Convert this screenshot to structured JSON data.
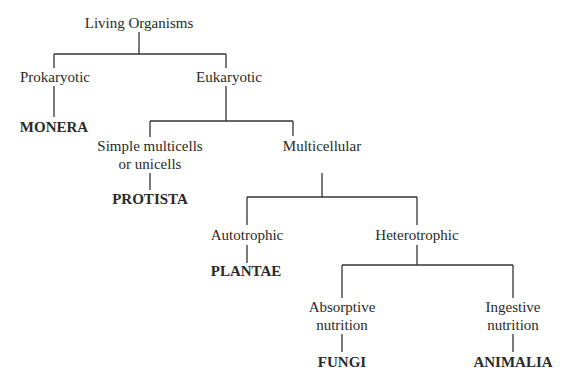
{
  "title": "Living Organisms",
  "nodes": {
    "root": "Living Organisms",
    "prokaryotic": "Prokaryotic",
    "eukaryotic": "Eukaryotic",
    "monera": "MONERA",
    "simple_line1": "Simple multicells",
    "simple_line2": "or unicells",
    "protista": "PROTISTA",
    "multicellular": "Multicellular",
    "autotrophic": "Autotrophic",
    "heterotrophic": "Heterotrophic",
    "plantae": "PLANTAE",
    "absorptive_line1": "Absorptive",
    "absorptive_line2": "nutrition",
    "ingestive_line1": "Ingestive",
    "ingestive_line2": "nutrition",
    "fungi": "FUNGI",
    "animalia": "ANIMALIA"
  },
  "line_color": "#333333"
}
